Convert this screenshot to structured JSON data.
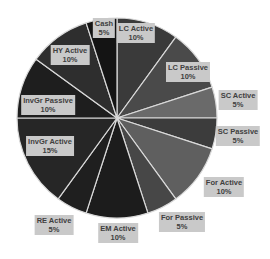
{
  "chart_data": {
    "type": "pie",
    "title": "",
    "start_angle_deg": 0,
    "direction": "clockwise",
    "center": [
      117,
      118
    ],
    "radius": 100,
    "slices": [
      {
        "label": "LC Active",
        "value": 10,
        "display": "10%",
        "color": "#3a3a3a",
        "label_pos": [
          136,
          33
        ]
      },
      {
        "label": "LC Passive",
        "value": 10,
        "display": "10%",
        "color": "#4a4a4a",
        "label_pos": [
          188,
          72
        ]
      },
      {
        "label": "SC Active",
        "value": 5,
        "display": "5%",
        "color": "#6a6a6a",
        "label_pos": [
          238,
          100
        ]
      },
      {
        "label": "SC Passive",
        "value": 5,
        "display": "5%",
        "color": "#3c3c3c",
        "label_pos": [
          238,
          136
        ]
      },
      {
        "label": "For Active",
        "value": 10,
        "display": "10%",
        "color": "#5f5f5f",
        "label_pos": [
          224,
          187
        ]
      },
      {
        "label": "For Passive",
        "value": 5,
        "display": "5%",
        "color": "#474747",
        "label_pos": [
          182,
          222
        ]
      },
      {
        "label": "EM Active",
        "value": 10,
        "display": "10%",
        "color": "#1c1c1c",
        "label_pos": [
          118,
          233
        ]
      },
      {
        "label": "RE Active",
        "value": 5,
        "display": "5%",
        "color": "#1f1f1f",
        "label_pos": [
          54,
          225
        ]
      },
      {
        "label": "InvGr Active",
        "value": 15,
        "display": "15%",
        "color": "#262626",
        "label_pos": [
          50,
          146
        ]
      },
      {
        "label": "InvGr Passive",
        "value": 10,
        "display": "10%",
        "color": "#1e1e1e",
        "label_pos": [
          48,
          105
        ]
      },
      {
        "label": "HY Active",
        "value": 10,
        "display": "10%",
        "color": "#2e2e2e",
        "label_pos": [
          70,
          55
        ]
      },
      {
        "label": "Cash",
        "value": 5,
        "display": "5%",
        "color": "#141414",
        "label_pos": [
          104,
          28
        ]
      }
    ],
    "separator_color": "#d9d9d9",
    "label_box_color": "#c9c9c9",
    "label_text_color": "#404040",
    "legend": "none"
  }
}
